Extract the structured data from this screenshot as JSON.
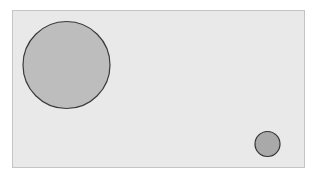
{
  "diagram": {
    "panel": {
      "x": 12,
      "y": 10,
      "width": 292,
      "height": 157,
      "fill": "#e9e9e9",
      "stroke": "#c4c4c4"
    },
    "circles": [
      {
        "name": "large-circle",
        "cx": 66.5,
        "cy": 65,
        "r": 43.5,
        "fill": "#bdbdbd",
        "stroke": "#3a3a3a"
      },
      {
        "name": "small-circle",
        "cx": 267.5,
        "cy": 144,
        "r": 12.5,
        "fill": "#a9a9a9",
        "stroke": "#333333"
      }
    ]
  }
}
